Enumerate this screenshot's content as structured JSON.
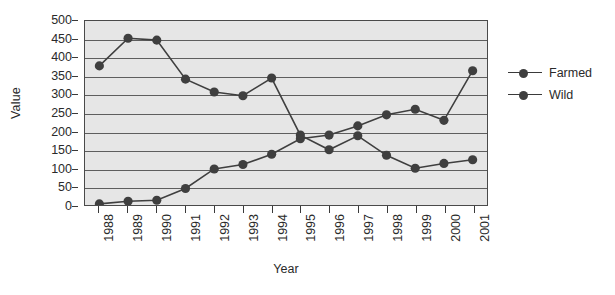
{
  "chart_data": {
    "type": "line",
    "title": "",
    "xlabel": "Year",
    "ylabel": "Value",
    "x": [
      1988,
      1989,
      1990,
      1991,
      1992,
      1993,
      1994,
      1995,
      1996,
      1997,
      1998,
      1999,
      2000,
      2001
    ],
    "xtick_labels": [
      "1988",
      "1989",
      "1990",
      "1991",
      "1992",
      "1993",
      "1994",
      "1995",
      "1996",
      "1997",
      "1998",
      "1999",
      "2000",
      "2001"
    ],
    "ytick_labels": [
      "500",
      "450",
      "400",
      "350",
      "300",
      "250",
      "200",
      "150",
      "100",
      "50",
      "0"
    ],
    "yticks": [
      500,
      450,
      400,
      350,
      300,
      250,
      200,
      150,
      100,
      50,
      0
    ],
    "ylim": [
      0,
      500
    ],
    "grid": true,
    "legend_position": "right",
    "series": [
      {
        "name": "Farmed",
        "color": "#3f3f3f",
        "marker": "circle",
        "values": [
          3,
          10,
          13,
          45,
          98,
          110,
          138,
          180,
          190,
          215,
          245,
          260,
          230,
          365
        ]
      },
      {
        "name": "Wild",
        "color": "#3f3f3f",
        "marker": "circle",
        "values": [
          378,
          453,
          448,
          342,
          307,
          297,
          345,
          190,
          150,
          188,
          135,
          100,
          113,
          123
        ]
      }
    ]
  },
  "legend": {
    "entries": [
      {
        "label": "Farmed"
      },
      {
        "label": "Wild"
      }
    ]
  },
  "axes": {
    "x_title": "Year",
    "y_title": "Value"
  },
  "style": {
    "plot_background": "#e6e6e6",
    "gridline_color": "#5e5e5e",
    "frame_color": "#4a4a4a",
    "series_color": "#3f3f3f",
    "page_background": "#ffffff"
  }
}
